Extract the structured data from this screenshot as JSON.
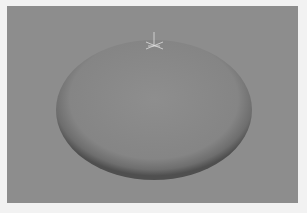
{
  "viewport": {
    "background_color": "#8d8d8d",
    "border_color": "#f2f2f2",
    "object": {
      "type": "ellipsoid",
      "center": [
        147,
        104
      ],
      "radius_x": 98,
      "radius_y": 70,
      "base_color": "#8a8a8a",
      "rim_shadow_color": "#555555"
    },
    "manipulator": {
      "type": "pivot-gizmo",
      "position": [
        147,
        38
      ],
      "color": "#e8e8e8"
    }
  }
}
